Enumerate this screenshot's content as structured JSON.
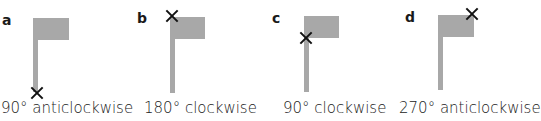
{
  "panels": [
    {
      "letter": "a",
      "caption": "90° anticlockwise",
      "centre_mark": "bottom of pole"
    },
    {
      "letter": "b",
      "caption": "180° clockwise",
      "centre_mark": "top of pole"
    },
    {
      "letter": "c",
      "caption": "90° clockwise",
      "centre_mark": "bottom-left of flag"
    },
    {
      "letter": "d",
      "caption": "270° anticlockwise",
      "centre_mark": "top-right of flag"
    }
  ],
  "colors": {
    "flag": "#a8a8a8",
    "mark": "#111111"
  }
}
